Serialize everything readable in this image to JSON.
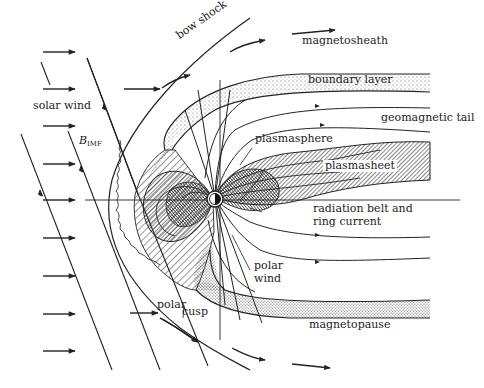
{
  "diagram": {
    "labels": {
      "magnetosheath": "magnetosheath",
      "bow_shock": "bow shock",
      "boundary_layer": "boundary layer",
      "solar_wind": "solar wind",
      "geomagnetic_tail": "geomagnetic tail",
      "b_imf_main": "B",
      "b_imf_sub": "IMF",
      "plasmasphere": "plasmasphere",
      "plasmasheet": "plasmasheet",
      "radiation_belt_line1": "radiation belt and",
      "radiation_belt_line2": "ring current",
      "polar_wind_line1": "polar",
      "polar_wind_line2": "wind",
      "polar_cusp_line1": "polar",
      "polar_cusp_line2": "cusp",
      "magnetopause": "magnetopause"
    },
    "colors": {
      "ink": "#222222",
      "background": "#ffffff",
      "stipple": "#555555"
    }
  }
}
